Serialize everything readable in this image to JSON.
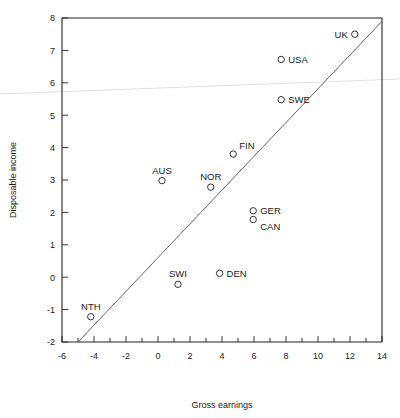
{
  "chart_data": {
    "type": "scatter",
    "title": "",
    "xlabel": "Gross earnings",
    "ylabel": "Disposable income",
    "xlim": [
      -6,
      14
    ],
    "ylim": [
      -2,
      8
    ],
    "xticks": [
      -6,
      -4,
      -2,
      0,
      2,
      4,
      6,
      8,
      10,
      12,
      14
    ],
    "xticklabels": [
      "-6",
      "-4",
      "-2",
      "0",
      "2",
      "4",
      "6",
      "8",
      "10",
      "12",
      "14"
    ],
    "xminor_step": 1,
    "yticks": [
      -2,
      -1,
      0,
      1,
      2,
      3,
      4,
      5,
      6,
      7,
      8
    ],
    "yticklabels": [
      "-2",
      "-1",
      "0",
      "1",
      "2",
      "3",
      "4",
      "5",
      "6",
      "7",
      "8"
    ],
    "grid": false,
    "legend": "none",
    "marker_style": "open-circle",
    "points": [
      {
        "label": "UK",
        "x": 12.3,
        "y": 7.5,
        "label_pos": "left"
      },
      {
        "label": "USA",
        "x": 7.7,
        "y": 6.72,
        "label_pos": "right"
      },
      {
        "label": "SWE",
        "x": 7.7,
        "y": 5.48,
        "label_pos": "right"
      },
      {
        "label": "FIN",
        "x": 4.7,
        "y": 3.8,
        "label_pos": "above-right"
      },
      {
        "label": "AUS",
        "x": 0.25,
        "y": 2.98,
        "label_pos": "above"
      },
      {
        "label": "NOR",
        "x": 3.3,
        "y": 2.78,
        "label_pos": "above"
      },
      {
        "label": "GER",
        "x": 5.95,
        "y": 2.05,
        "label_pos": "right"
      },
      {
        "label": "CAN",
        "x": 5.95,
        "y": 1.78,
        "label_pos": "below-right"
      },
      {
        "label": "DEN",
        "x": 3.85,
        "y": 0.12,
        "label_pos": "right"
      },
      {
        "label": "SWI",
        "x": 1.25,
        "y": -0.22,
        "label_pos": "above"
      },
      {
        "label": "NTH",
        "x": -4.2,
        "y": -1.22,
        "label_pos": "above"
      }
    ],
    "reference_line": {
      "kind": "diagonal",
      "x_start": -5.0,
      "y_start": -2.0,
      "x_end": 14.0,
      "y_end": 7.9
    },
    "artifact_line": {
      "kind": "scan-artifact-horizontal",
      "note": "faint grey near-horizontal streak across full image"
    }
  }
}
